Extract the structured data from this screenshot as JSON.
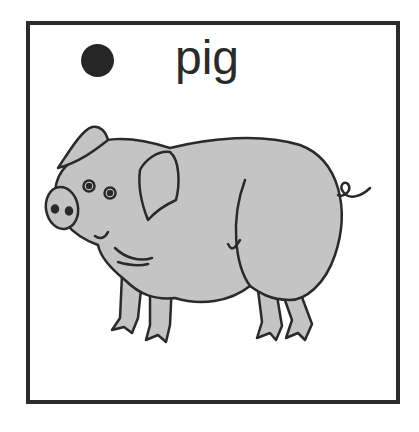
{
  "card": {
    "word": "pig",
    "bullet": "filled-circle",
    "illustration": "pig-icon"
  },
  "colors": {
    "border": "#2b2b2b",
    "pig_fill": "#c4c4c4",
    "pig_outline": "#2a2a2a",
    "dot": "#262626"
  }
}
